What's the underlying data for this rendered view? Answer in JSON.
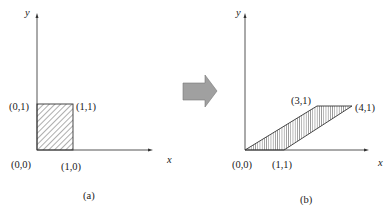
{
  "panel_a": {
    "caption": "(a)",
    "x_axis_label": "x",
    "y_axis_label": "y",
    "points": {
      "p00": "(0,0)",
      "p01": "(0,1)",
      "p11": "(1,1)",
      "p10": "(1,0)"
    },
    "shape": "unit square, hatched"
  },
  "transition_arrow": {
    "label": "transform",
    "color": "#a0a0a0"
  },
  "panel_b": {
    "caption": "(b)",
    "x_axis_label": "x",
    "y_axis_label": "y",
    "points": {
      "p00": "(0,0)",
      "p11_bottom": "(1,1)",
      "p31": "(3,1)",
      "p41": "(4,1)"
    },
    "shape": "sheared parallelogram, hatched"
  }
}
